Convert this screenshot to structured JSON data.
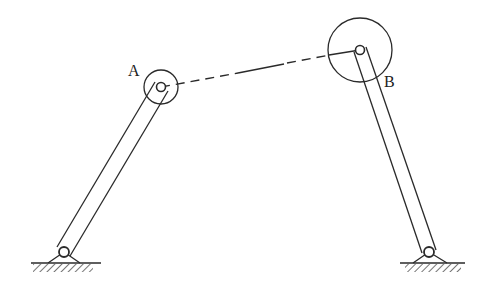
{
  "diagram": {
    "type": "four-bar-linkage",
    "colors": {
      "line": "#2a2a2a",
      "background": "#ffffff"
    },
    "labels": {
      "A": "A",
      "B": "B"
    },
    "joints": {
      "A": {
        "x": 161,
        "y": 87,
        "outer_r": 17,
        "inner_r": 4
      },
      "B": {
        "x": 360,
        "y": 50,
        "outer_r": 32,
        "inner_r": 4
      }
    },
    "ground_pivots": {
      "left": {
        "x": 64,
        "y": 252
      },
      "right": {
        "x": 429,
        "y": 252
      }
    },
    "coupler_style": "dashed"
  }
}
